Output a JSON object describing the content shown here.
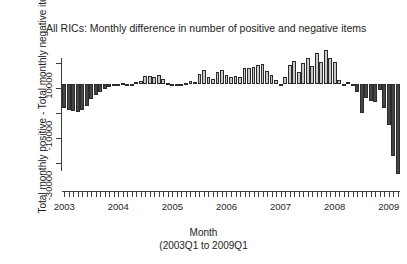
{
  "chart_data": {
    "type": "bar",
    "title": "All RICs: Monthly difference in number of positive and negative items",
    "xlabel_line1": "Month",
    "xlabel_line2": "(2003Q1 to 2009Q1",
    "ylabel": "Total monthly positive - Total monthly negative items",
    "grid": false,
    "legend": "none",
    "ylim": [
      -36000,
      14000
    ],
    "yticks": [
      10000,
      -10000,
      -30000
    ],
    "ytick_labels": [
      "10000",
      "-10000",
      "-30000"
    ],
    "yminor_ticks": [
      0,
      -20000
    ],
    "xlim": [
      "2003-01",
      "2009-03"
    ],
    "xticks": [
      "2003",
      "2004",
      "2005",
      "2006",
      "2007",
      "2008",
      "2009"
    ],
    "xtick_labels": [
      "2003",
      "2004",
      "2005",
      "2006",
      "2007",
      "2008",
      "2009"
    ],
    "xminor_tick_interval": "month",
    "colors": {
      "positive_fill": "#c9c9c9",
      "negative_fill": "#464646",
      "bar_border": "#2b2b2b",
      "axis": "#3c3c3c",
      "text": "#1f1f1f",
      "background": "#ffffff"
    },
    "categories": [
      "2003-01",
      "2003-02",
      "2003-03",
      "2003-04",
      "2003-05",
      "2003-06",
      "2003-07",
      "2003-08",
      "2003-09",
      "2003-10",
      "2003-11",
      "2003-12",
      "2004-01",
      "2004-02",
      "2004-03",
      "2004-04",
      "2004-05",
      "2004-06",
      "2004-07",
      "2004-08",
      "2004-09",
      "2004-10",
      "2004-11",
      "2004-12",
      "2005-01",
      "2005-02",
      "2005-03",
      "2005-04",
      "2005-05",
      "2005-06",
      "2005-07",
      "2005-08",
      "2005-09",
      "2005-10",
      "2005-11",
      "2005-12",
      "2006-01",
      "2006-02",
      "2006-03",
      "2006-04",
      "2006-05",
      "2006-06",
      "2006-07",
      "2006-08",
      "2006-09",
      "2006-10",
      "2006-11",
      "2006-12",
      "2007-01",
      "2007-02",
      "2007-03",
      "2007-04",
      "2007-05",
      "2007-06",
      "2007-07",
      "2007-08",
      "2007-09",
      "2007-10",
      "2007-11",
      "2007-12",
      "2008-01",
      "2008-02",
      "2008-03",
      "2008-04",
      "2008-05",
      "2008-06",
      "2008-07",
      "2008-08",
      "2008-09",
      "2008-10",
      "2008-11",
      "2008-12",
      "2009-01",
      "2009-02",
      "2009-03"
    ],
    "values": [
      -8200,
      -9000,
      -9400,
      -9700,
      -8800,
      -7600,
      -5200,
      -3600,
      -2600,
      -1600,
      -900,
      -600,
      -300,
      300,
      -200,
      -400,
      900,
      1000,
      2900,
      2800,
      2500,
      3400,
      1700,
      600,
      -200,
      -300,
      -100,
      600,
      1100,
      900,
      3500,
      5000,
      2600,
      1800,
      4400,
      5100,
      3300,
      2700,
      3000,
      2500,
      5500,
      5700,
      6100,
      6600,
      7200,
      4700,
      3200,
      1500,
      -200,
      2400,
      6700,
      8200,
      4400,
      7400,
      9300,
      6300,
      11000,
      7600,
      12000,
      9200,
      7800,
      1400,
      -400,
      800,
      -700,
      -2700,
      -10000,
      -4600,
      -5800,
      -6200,
      -2000,
      -8300,
      -14000,
      -25000,
      -31000
    ],
    "extra_values_note": "",
    "annotations": []
  },
  "figure": {
    "background": "#ffffff"
  }
}
